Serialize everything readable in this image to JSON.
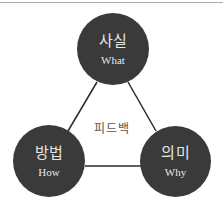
{
  "diagram": {
    "title": "",
    "center_label": "피드백",
    "nodes": [
      {
        "id": "top",
        "ko": "사실",
        "en": "What"
      },
      {
        "id": "bottom-left",
        "ko": "방법",
        "en": "How"
      },
      {
        "id": "bottom-right",
        "ko": "의미",
        "en": "Why"
      }
    ],
    "edges": [
      {
        "from": "top",
        "to": "bottom-left"
      },
      {
        "from": "top",
        "to": "bottom-right"
      },
      {
        "from": "bottom-left",
        "to": "bottom-right"
      }
    ],
    "colors": {
      "node_fill": "#3a3a3a",
      "node_text": "#e6e6e6",
      "line": "#2a2a2a",
      "center_text": "#555555"
    }
  }
}
